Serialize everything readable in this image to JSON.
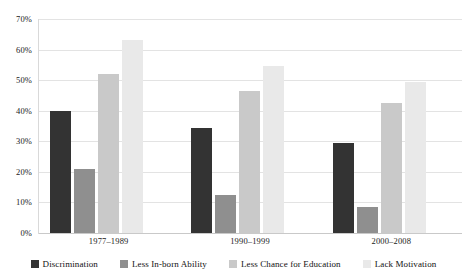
{
  "chart_data": {
    "type": "bar",
    "title": "",
    "xlabel": "",
    "ylabel": "",
    "ylim": [
      0,
      70
    ],
    "ytick_values": [
      0,
      10,
      20,
      30,
      40,
      50,
      60,
      70
    ],
    "ytick_labels": [
      "0%",
      "10%",
      "20%",
      "30%",
      "40%",
      "50%",
      "60%",
      "70%"
    ],
    "grid": true,
    "legend_position": "bottom",
    "categories": [
      "1977–1989",
      "1990–1999",
      "2000–2008"
    ],
    "series": [
      {
        "name": "Discrimination",
        "color": "#333333",
        "values": [
          40.0,
          34.5,
          29.5
        ]
      },
      {
        "name": "Less In-born Ability",
        "color": "#8f8f8f",
        "values": [
          21.0,
          12.5,
          8.5
        ]
      },
      {
        "name": "Less Chance for Education",
        "color": "#c9c9c9",
        "values": [
          52.0,
          46.5,
          42.5
        ]
      },
      {
        "name": "Lack Motivation",
        "color": "#e9e9e9",
        "values": [
          63.0,
          54.5,
          49.5
        ]
      }
    ]
  },
  "axis": {
    "gridline_color": "#e3e3e3",
    "baseline_color": "#c9c9c9"
  }
}
